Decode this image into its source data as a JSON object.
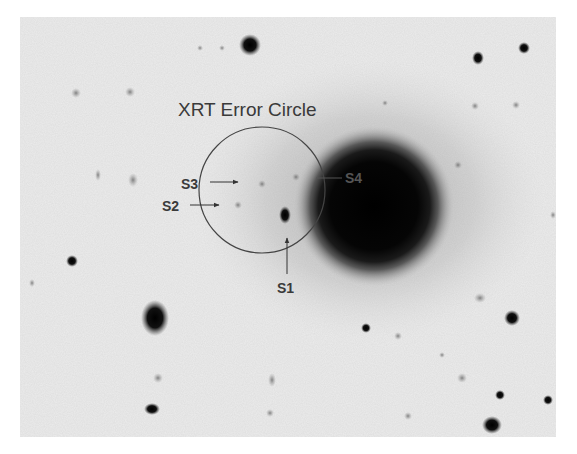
{
  "figure": {
    "title_label": "XRT Error Circle",
    "sources": [
      {
        "id": "S1",
        "label": "S1",
        "x": 284,
        "y": 215
      },
      {
        "id": "S2",
        "label": "S2",
        "x": 230,
        "y": 205
      },
      {
        "id": "S3",
        "label": "S3",
        "x": 250,
        "y": 183
      },
      {
        "id": "S4",
        "label": "S4",
        "x": 354,
        "y": 178
      }
    ],
    "error_circle": {
      "cx": 262,
      "cy": 190,
      "r": 63
    },
    "galaxy": {
      "cx": 374,
      "cy": 206,
      "r": 62
    },
    "colors": {
      "background": "#f2f2f2",
      "frame_bg": "#ececec",
      "ink": "#111111",
      "circle": "#444444",
      "label": "#3a3a3a",
      "s4_label": "#555555"
    }
  }
}
